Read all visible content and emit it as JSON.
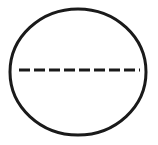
{
  "figure": {
    "type": "geometric-diagram",
    "canvas": {
      "width": 158,
      "height": 145,
      "background_color": "#FFFFFF"
    },
    "shapes": {
      "circle": {
        "name": "circle-outline",
        "center_x": 78,
        "center_y": 72,
        "radius_x": 68,
        "radius_y": 63,
        "stroke_color": "#1A1A1A",
        "stroke_width": 3,
        "fill": "none",
        "bounds": {
          "left": 10,
          "right": 146,
          "top": 9,
          "bottom": 135
        }
      },
      "dashed_line": {
        "name": "dashed-diameter-line",
        "x_start": 19,
        "x_end": 140,
        "y": 70,
        "stroke_color": "#1A1A1A",
        "stroke_width": 3,
        "dash_length": 11,
        "gap_length": 4,
        "dash_count": 8,
        "orientation": "horizontal"
      }
    },
    "labels": [],
    "annotations": []
  }
}
